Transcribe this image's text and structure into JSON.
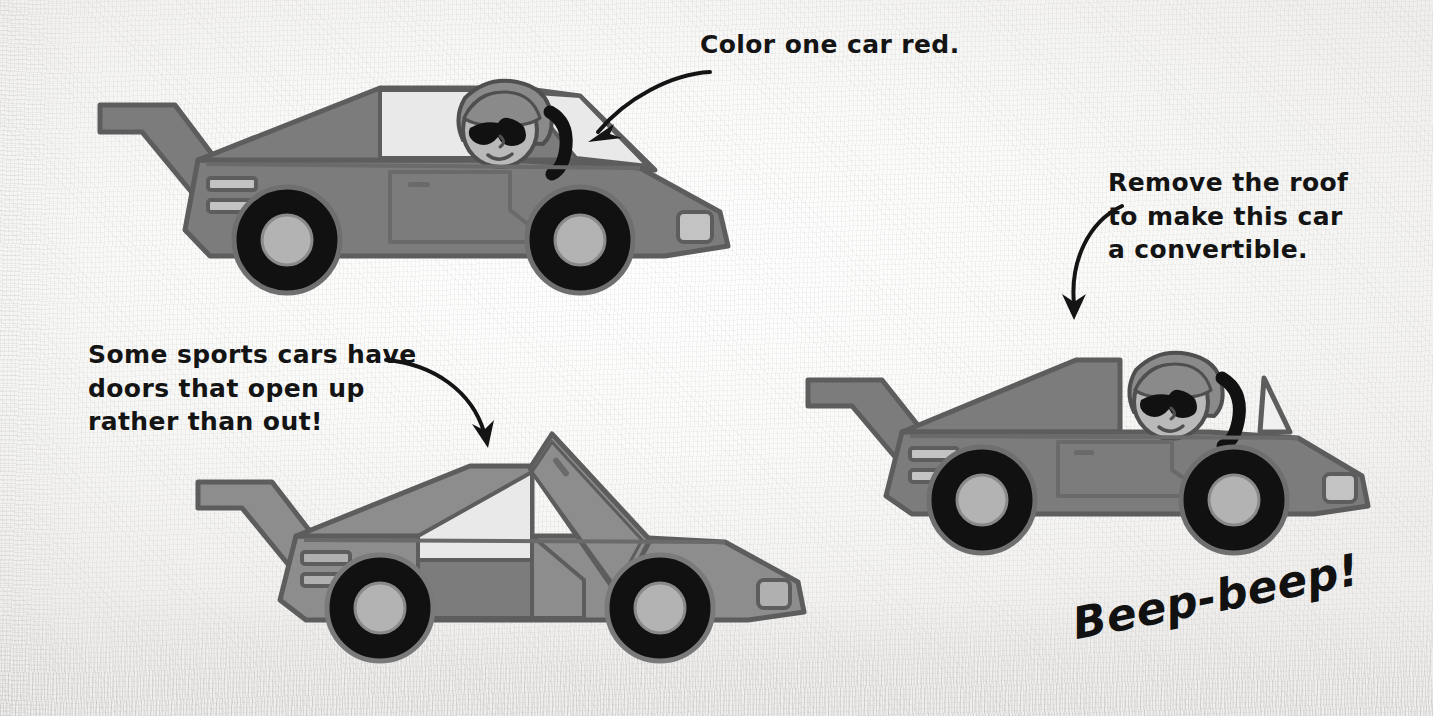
{
  "page": {
    "background_color": "#f4f4f3"
  },
  "callouts": [
    {
      "id": "color-one-car-red",
      "text": "Color one car red.",
      "points_to": "car-coupe"
    },
    {
      "id": "remove-the-roof",
      "text": "Remove the roof\nto make this car\na convertible.",
      "points_to": "car-convertible"
    },
    {
      "id": "some-sports-cars",
      "text": "Some sports cars have\ndoors that open up\nrather than out!",
      "points_to": "car-gullwing"
    }
  ],
  "sound_effect": {
    "text": "Beep-beep!"
  },
  "cars": [
    {
      "id": "car-coupe",
      "name": "coupe-with-roof",
      "has_roof": true,
      "has_driver": true,
      "door_style": "conventional"
    },
    {
      "id": "car-gullwing",
      "name": "sports-car-gullwing-door",
      "has_roof": true,
      "has_driver": false,
      "door_style": "gull-wing-open-up"
    },
    {
      "id": "car-convertible",
      "name": "convertible-no-roof",
      "has_roof": false,
      "has_driver": true,
      "door_style": "conventional"
    }
  ],
  "colors": {
    "body": "#7c7c7c",
    "body_dark": "#6e6e6e",
    "body_light": "#8d8d8d",
    "outline": "#5d5d5d",
    "window": "#e9e9e9",
    "tire": "#111111",
    "hubcap": "#b3b3b3",
    "lamp": "#c3c3c3",
    "skin": "#b9b9b9",
    "hair": "#8a8a8a",
    "ink": "#141414"
  }
}
